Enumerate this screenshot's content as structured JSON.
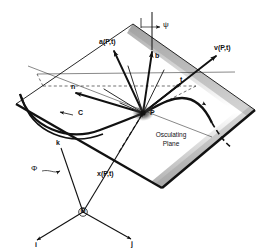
{
  "figure": {
    "background_color": "#ffffff",
    "ink_color": "#111111",
    "plane_fill": "#ffffff",
    "plane_edge_shade": "#8a8a8a"
  },
  "labels": {
    "acceleration": "a(P,t)",
    "binormal": "b",
    "velocity": "v(P,t)",
    "tangent": "t",
    "normal": "n",
    "curve": "C",
    "point": "P",
    "psi": "ψ",
    "phi": "Φ",
    "osculating_plane_line1": "Osculating",
    "osculating_plane_line2": "Plane",
    "position_vector": "x(P,t)",
    "origin": "O",
    "basis_i": "i",
    "basis_j": "j",
    "basis_k": "k"
  },
  "geometry": {
    "point_P": [
      143,
      113
    ],
    "origin_O": [
      83,
      212
    ],
    "plane_corners": [
      [
        16,
        104
      ],
      [
        133,
        24
      ],
      [
        255,
        110
      ],
      [
        162,
        188
      ]
    ],
    "vectors": [
      {
        "name": "acceleration",
        "from": [
          143,
          113
        ],
        "to": [
          113,
          49
        ]
      },
      {
        "name": "binormal",
        "from": [
          143,
          113
        ],
        "to": [
          152,
          50
        ]
      },
      {
        "name": "velocity",
        "from": [
          143,
          113
        ],
        "to": [
          218,
          54
        ]
      },
      {
        "name": "normal",
        "from": [
          143,
          113
        ],
        "to": [
          74,
          92
        ]
      },
      {
        "name": "position",
        "from": [
          83,
          212
        ],
        "to": [
          143,
          113
        ]
      },
      {
        "name": "basis_i",
        "from": [
          83,
          212
        ],
        "to": [
          35,
          241
        ]
      },
      {
        "name": "basis_j",
        "from": [
          83,
          212
        ],
        "to": [
          133,
          240
        ]
      },
      {
        "name": "basis_k",
        "from": [
          83,
          212
        ],
        "to": [
          61,
          147
        ]
      }
    ]
  }
}
